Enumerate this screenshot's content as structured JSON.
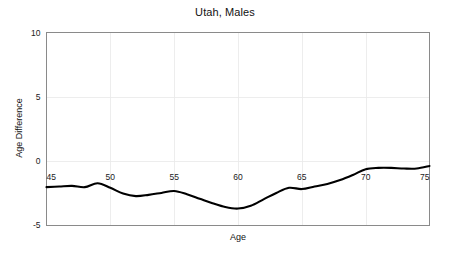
{
  "chart_data": {
    "type": "line",
    "title": "Utah, Males",
    "xlabel": "Age",
    "ylabel": "Age Difference",
    "xlim": [
      45,
      75
    ],
    "ylim": [
      -5,
      10
    ],
    "grid": true,
    "legend": "none",
    "xticks": [
      45,
      50,
      55,
      60,
      65,
      70,
      75
    ],
    "xtick_labels": [
      "45",
      "50",
      "55",
      "60",
      "65",
      "70",
      "75"
    ],
    "yticks": [
      -5,
      0,
      5,
      10
    ],
    "ytick_labels": [
      "-5",
      "0",
      "5",
      "10"
    ],
    "series": [
      {
        "name": "Age Difference",
        "color": "#000000",
        "x": [
          45,
          46,
          47,
          48,
          49,
          50,
          51,
          52,
          53,
          54,
          55,
          56,
          57,
          58,
          59,
          60,
          61,
          62,
          63,
          64,
          65,
          66,
          67,
          68,
          69,
          70,
          71,
          72,
          73,
          74,
          75
        ],
        "y": [
          -2.05,
          -2.0,
          -1.95,
          -2.05,
          -1.75,
          -2.1,
          -2.55,
          -2.75,
          -2.65,
          -2.5,
          -2.35,
          -2.6,
          -2.95,
          -3.3,
          -3.6,
          -3.72,
          -3.5,
          -3.0,
          -2.5,
          -2.1,
          -2.2,
          -2.0,
          -1.8,
          -1.5,
          -1.1,
          -0.65,
          -0.55,
          -0.55,
          -0.6,
          -0.6,
          -0.4
        ]
      }
    ]
  },
  "labels": {
    "title": "Utah, Males",
    "x_axis_title": "Age",
    "y_axis_title": "Age Difference"
  }
}
